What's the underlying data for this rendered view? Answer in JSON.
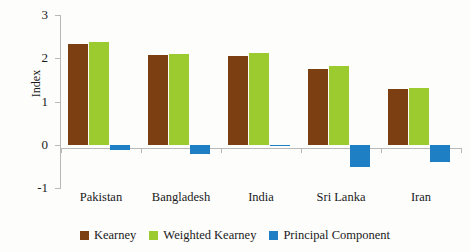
{
  "chart_data": {
    "type": "bar",
    "title": "",
    "xlabel": "",
    "ylabel": "Index",
    "ylim": [
      -1,
      3
    ],
    "yticks": [
      3,
      2,
      1,
      0,
      -1
    ],
    "ytick_labels": [
      "3",
      "2",
      "1",
      "0",
      "-1"
    ],
    "grid": false,
    "legend_position": "bottom",
    "categories": [
      "Pakistan",
      "Bangladesh",
      "India",
      "Sri Lanka",
      "Iran"
    ],
    "series": [
      {
        "name": "Kearney",
        "color": "#7B3F12",
        "values": [
          2.33,
          2.08,
          2.06,
          1.76,
          1.3
        ]
      },
      {
        "name": "Weighted Kearney",
        "color": "#9BCB2E",
        "values": [
          2.38,
          2.09,
          2.13,
          1.83,
          1.32
        ]
      },
      {
        "name": "Principal Component",
        "color": "#1F7FC4",
        "values": [
          -0.12,
          -0.21,
          -0.04,
          -0.51,
          -0.39
        ]
      }
    ]
  },
  "axis": {
    "y_title": "Index",
    "axis_color": "#b9b9b9"
  },
  "legend": {
    "items": [
      {
        "label": "Kearney",
        "color": "#7B3F12"
      },
      {
        "label": "Weighted Kearney",
        "color": "#9BCB2E"
      },
      {
        "label": "Principal Component",
        "color": "#1F7FC4"
      }
    ]
  }
}
